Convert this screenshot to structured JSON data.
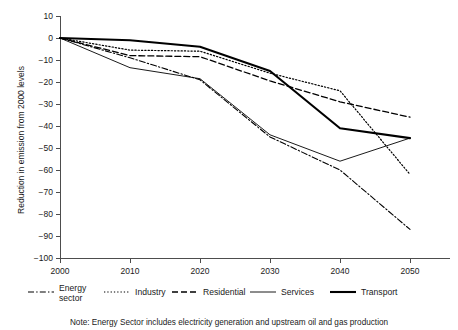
{
  "chart_data": {
    "type": "line",
    "title": "",
    "xlabel": "",
    "ylabel": "Reduction in emission from 2000 levels",
    "x": [
      2000,
      2010,
      2020,
      2030,
      2040,
      2050
    ],
    "categories": [
      "2000",
      "2010",
      "2020",
      "2030",
      "2040",
      "2050"
    ],
    "xlim": [
      2000,
      2050
    ],
    "ylim": [
      -100,
      10
    ],
    "yticks": [
      "10",
      "0",
      "−10",
      "−20",
      "−30",
      "−40",
      "−50",
      "−60",
      "−70",
      "−80",
      "−90",
      "−100"
    ],
    "ytick_values": [
      10,
      0,
      -10,
      -20,
      -30,
      -40,
      -50,
      -60,
      -70,
      -80,
      -90,
      -100
    ],
    "grid": false,
    "legend_position": "bottom",
    "series": [
      {
        "name": "Energy sector",
        "style": "dash-dot",
        "values": [
          0,
          -9,
          -19,
          -45,
          -60,
          -87
        ]
      },
      {
        "name": "Industry",
        "style": "dotted",
        "values": [
          0,
          -5.5,
          -6,
          -16,
          -24,
          -62
        ]
      },
      {
        "name": "Residential",
        "style": "dashed",
        "values": [
          0,
          -8,
          -8.5,
          -19.5,
          -29,
          -36
        ]
      },
      {
        "name": "Services",
        "style": "solid-thin",
        "values": [
          0,
          -13.5,
          -18.5,
          -44,
          -56,
          -45.5
        ]
      },
      {
        "name": "Transport",
        "style": "solid-thick",
        "values": [
          0,
          -1,
          -4,
          -15,
          -41,
          -45.5
        ]
      }
    ],
    "note": "Note: Energy Sector includes electricity generation and upstream oil and gas production"
  },
  "legend": {
    "items": [
      {
        "label_line1": "Energy",
        "label_line2": "sector",
        "style": "dash-dot"
      },
      {
        "label_line1": "Industry",
        "label_line2": "",
        "style": "dotted"
      },
      {
        "label_line1": "Residential",
        "label_line2": "",
        "style": "dashed"
      },
      {
        "label_line1": "Services",
        "label_line2": "",
        "style": "solid-thin"
      },
      {
        "label_line1": "Transport",
        "label_line2": "",
        "style": "solid-thick"
      }
    ]
  },
  "colors": {
    "line": "#000000",
    "axis": "#4d4d4d",
    "text": "#1a1a1a",
    "background": "#ffffff"
  }
}
